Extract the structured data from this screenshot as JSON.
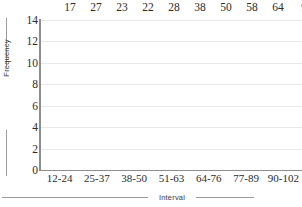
{
  "chart_data": {
    "type": "bar",
    "title": "",
    "xlabel": "Interval",
    "ylabel": "Frequency",
    "categories": [
      "12-24",
      "25-37",
      "38-50",
      "51-63",
      "64-76",
      "77-89",
      "90-102"
    ],
    "values": [
      null,
      null,
      null,
      null,
      null,
      null,
      null
    ],
    "ylim": [
      0,
      14
    ],
    "ytick_labels": [
      "0",
      "2",
      "4",
      "6",
      "8",
      "10",
      "12",
      "14"
    ],
    "ytick_values": [
      0,
      2,
      4,
      6,
      8,
      10,
      12,
      14
    ],
    "grid": true,
    "legend": "none"
  },
  "top_row": {
    "values": [
      "17",
      "27",
      "23",
      "22",
      "28",
      "38",
      "50",
      "58",
      "64"
    ],
    "truncated_value": "9"
  },
  "colors": {
    "gridline": "#e9e9e9",
    "axis": "#8e8e8e",
    "text": "#2b2b2b",
    "axis_title_text": "#3a3a3a",
    "background": "#ffffff"
  }
}
